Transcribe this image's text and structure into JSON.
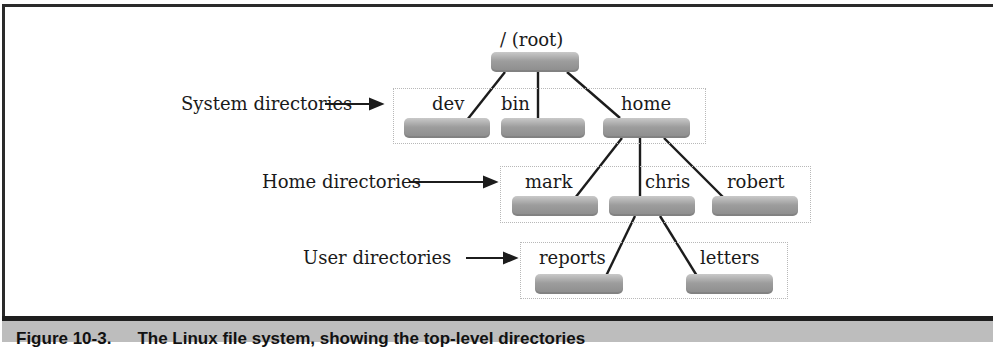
{
  "diagram": {
    "root": {
      "label": "/ (root)"
    },
    "groups": [
      {
        "label": "System directories",
        "children": [
          "dev",
          "bin",
          "home"
        ]
      },
      {
        "label": "Home directories",
        "children": [
          "mark",
          "chris",
          "robert"
        ]
      },
      {
        "label": "User directories",
        "children": [
          "reports",
          "letters"
        ]
      }
    ],
    "nodes": {
      "dev": "dev",
      "bin": "bin",
      "home": "home",
      "mark": "mark",
      "chris": "chris",
      "robert": "robert",
      "reports": "reports",
      "letters": "letters"
    },
    "edges": [
      [
        "root",
        "dev"
      ],
      [
        "root",
        "bin"
      ],
      [
        "root",
        "home"
      ],
      [
        "home",
        "mark"
      ],
      [
        "home",
        "chris"
      ],
      [
        "home",
        "robert"
      ],
      [
        "chris",
        "reports"
      ],
      [
        "chris",
        "letters"
      ]
    ]
  },
  "caption": {
    "figure_number": "Figure 10-3.",
    "text": "The Linux file system, showing the top-level directories"
  }
}
